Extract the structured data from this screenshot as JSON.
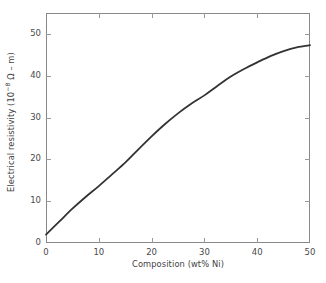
{
  "chart_data": {
    "type": "line",
    "title": "",
    "xlabel": "Composition (wt% Ni)",
    "ylabel": "Electrical resistivity (10-8 Ω – m)",
    "ylabel_parts": {
      "prefix": "Electrical resistivity (10",
      "exponent": "−8",
      "suffix": " Ω – m)"
    },
    "xlim": [
      0,
      50
    ],
    "ylim": [
      0,
      55
    ],
    "grid": false,
    "legend": null,
    "xticks": [
      "0",
      "10",
      "20",
      "30",
      "40",
      "50"
    ],
    "xtick_values": [
      0,
      10,
      20,
      30,
      40,
      50
    ],
    "yticks": [
      "0",
      "10",
      "20",
      "30",
      "40",
      "50"
    ],
    "ytick_values": [
      0,
      10,
      20,
      30,
      40,
      50
    ],
    "x_minor_interval": 10,
    "series": [
      {
        "name": "Electrical resistivity",
        "color": "#333333",
        "line_width": 1.8,
        "x": [
          0,
          2.5,
          5,
          7.5,
          10,
          12.5,
          15,
          17.5,
          20,
          22.5,
          25,
          27.5,
          30,
          32.5,
          35,
          37.5,
          40,
          42.5,
          45,
          47.5,
          50
        ],
        "values": [
          2.0,
          5.1,
          8.2,
          11.0,
          13.6,
          16.4,
          19.2,
          22.4,
          25.5,
          28.4,
          31.0,
          33.3,
          35.3,
          37.6,
          39.8,
          41.6,
          43.2,
          44.7,
          45.9,
          46.8,
          47.3
        ]
      }
    ],
    "annotations": []
  },
  "plot_area": {
    "left": 46,
    "top": 13,
    "right": 310,
    "bottom": 243,
    "frame_color": "#888888",
    "frame_width": 1,
    "tick_color": "#999999",
    "tick_length": 5
  }
}
